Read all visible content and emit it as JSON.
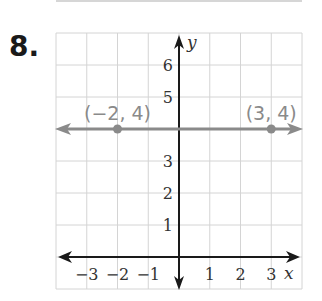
{
  "problem": {
    "number": "8."
  },
  "chart_data": {
    "type": "line",
    "title": "",
    "xlabel": "x",
    "ylabel": "y",
    "xlim": [
      -4,
      4
    ],
    "ylim": [
      -1,
      7
    ],
    "grid": true,
    "x_ticks": [
      {
        "value": -3,
        "label": "−3"
      },
      {
        "value": -2,
        "label": "−2"
      },
      {
        "value": -1,
        "label": "−1"
      },
      {
        "value": 1,
        "label": "1"
      },
      {
        "value": 2,
        "label": "2"
      },
      {
        "value": 3,
        "label": "3"
      }
    ],
    "y_ticks": [
      {
        "value": 1,
        "label": "1"
      },
      {
        "value": 2,
        "label": "2"
      },
      {
        "value": 3,
        "label": "3"
      },
      {
        "value": 5,
        "label": "5"
      },
      {
        "value": 6,
        "label": "6"
      }
    ],
    "series": [
      {
        "name": "horizontal line y = 4",
        "color": "#8a8a8a",
        "line": {
          "y": 4,
          "arrows": "both"
        },
        "points": [
          {
            "x": -2,
            "y": 4,
            "label": "(−2, 4)"
          },
          {
            "x": 3,
            "y": 4,
            "label": "(3, 4)"
          }
        ]
      }
    ]
  },
  "colors": {
    "grid": "#d4d4d4",
    "axis": "#1a1a1a",
    "series": "#8a8a8a"
  }
}
